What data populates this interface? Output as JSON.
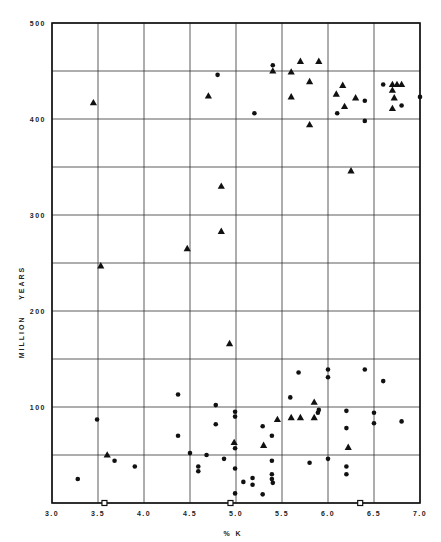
{
  "chart_data": {
    "type": "scatter",
    "title": "",
    "xlabel": "% K",
    "ylabel": "MILLION    YEARS",
    "xlim": [
      3.0,
      7.0
    ],
    "ylim": [
      0,
      500
    ],
    "x_ticks": [
      "3.0",
      "3.5",
      "4.0",
      "4.5",
      "5.0",
      "5.5",
      "6.0",
      "6.5",
      "7.0"
    ],
    "y_ticks": [
      "100",
      "200",
      "300",
      "400",
      "500"
    ],
    "grid": true,
    "grid_x_step": 0.5,
    "grid_y_step": 50,
    "legend": null,
    "series": [
      {
        "name": "triangles",
        "marker": "triangle",
        "points": [
          [
            3.45,
            417
          ],
          [
            3.53,
            247
          ],
          [
            4.47,
            265
          ],
          [
            4.7,
            424
          ],
          [
            4.84,
            330
          ],
          [
            4.84,
            283
          ],
          [
            4.93,
            166
          ],
          [
            5.4,
            450
          ],
          [
            5.6,
            449
          ],
          [
            5.7,
            460
          ],
          [
            5.9,
            460
          ],
          [
            5.8,
            439
          ],
          [
            5.6,
            423
          ],
          [
            5.8,
            394
          ],
          [
            6.09,
            426
          ],
          [
            6.16,
            435
          ],
          [
            6.18,
            413
          ],
          [
            6.3,
            422
          ],
          [
            6.25,
            346
          ],
          [
            6.7,
            436
          ],
          [
            6.75,
            436
          ],
          [
            6.8,
            436
          ],
          [
            6.7,
            430
          ],
          [
            6.72,
            422
          ],
          [
            6.7,
            411
          ],
          [
            3.6,
            50
          ],
          [
            4.98,
            63
          ],
          [
            5.3,
            60
          ],
          [
            5.45,
            87
          ],
          [
            5.6,
            89
          ],
          [
            5.7,
            89
          ],
          [
            5.85,
            89
          ],
          [
            5.85,
            105
          ],
          [
            6.22,
            58
          ]
        ]
      },
      {
        "name": "dots",
        "marker": "circle",
        "points": [
          [
            5.4,
            456
          ],
          [
            4.8,
            446
          ],
          [
            5.2,
            406
          ],
          [
            6.1,
            406
          ],
          [
            6.4,
            419
          ],
          [
            6.4,
            398
          ],
          [
            6.6,
            436
          ],
          [
            6.8,
            414
          ],
          [
            7.0,
            423
          ],
          [
            4.37,
            113
          ],
          [
            3.49,
            87
          ],
          [
            4.37,
            70
          ],
          [
            3.68,
            44
          ],
          [
            3.9,
            38
          ],
          [
            3.28,
            25
          ],
          [
            4.78,
            102
          ],
          [
            4.99,
            95
          ],
          [
            4.99,
            90
          ],
          [
            4.78,
            82
          ],
          [
            5.29,
            80
          ],
          [
            5.39,
            70
          ],
          [
            4.99,
            57
          ],
          [
            4.5,
            52
          ],
          [
            4.68,
            50
          ],
          [
            4.87,
            46
          ],
          [
            5.39,
            44
          ],
          [
            4.59,
            38
          ],
          [
            4.59,
            33
          ],
          [
            4.99,
            36
          ],
          [
            5.08,
            22
          ],
          [
            5.18,
            26
          ],
          [
            5.18,
            19
          ],
          [
            5.39,
            30
          ],
          [
            5.39,
            25
          ],
          [
            5.4,
            21
          ],
          [
            4.99,
            10
          ],
          [
            5.29,
            9
          ],
          [
            5.68,
            136
          ],
          [
            6.0,
            139
          ],
          [
            6.0,
            131
          ],
          [
            5.59,
            110
          ],
          [
            5.9,
            97
          ],
          [
            5.89,
            94
          ],
          [
            6.2,
            96
          ],
          [
            6.2,
            78
          ],
          [
            5.8,
            42
          ],
          [
            6.0,
            46
          ],
          [
            6.2,
            38
          ],
          [
            6.2,
            30
          ],
          [
            6.4,
            139
          ],
          [
            6.6,
            127
          ],
          [
            6.5,
            94
          ],
          [
            6.5,
            83
          ],
          [
            6.8,
            85
          ]
        ]
      },
      {
        "name": "open squares",
        "marker": "square-open",
        "points": [
          [
            3.57,
            0
          ],
          [
            4.94,
            0
          ],
          [
            6.35,
            0
          ]
        ]
      }
    ]
  },
  "colors": {
    "ink": "#111111",
    "grid": "#333333",
    "background": "#ffffff"
  }
}
